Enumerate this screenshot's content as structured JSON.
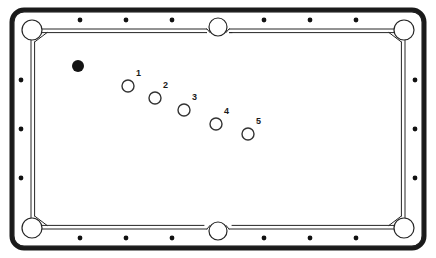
{
  "diagram": {
    "type": "pool-table-top-view",
    "width": 436,
    "height": 258,
    "colors": {
      "frame": "#1a1a1a",
      "cloth": "#ffffff",
      "rail": "#ffffff",
      "cushion_line": "#262626",
      "diamond": "#111111",
      "cue_ball": "#141414",
      "object_ball_outline": "#333333",
      "label_text": "#1a1a1a",
      "page_background": "#ffffff"
    }
  },
  "table": {
    "frame": {
      "name": "outer-frame",
      "x": 12,
      "y": 10,
      "width": 412,
      "height": 238,
      "corner_radius": 12,
      "stroke_width": 5
    },
    "playfield": {
      "name": "cloth-surface",
      "x": 31,
      "y": 29,
      "width": 374,
      "height": 200
    },
    "rail_width": 19
  },
  "pockets": [
    {
      "name": "pocket-top-left",
      "position": "top-left",
      "cx": 32,
      "cy": 30,
      "r": 10
    },
    {
      "name": "pocket-top-middle",
      "position": "top-middle",
      "cx": 218,
      "cy": 27,
      "r": 9
    },
    {
      "name": "pocket-top-right",
      "position": "top-right",
      "cx": 404,
      "cy": 30,
      "r": 10
    },
    {
      "name": "pocket-bottom-left",
      "position": "bottom-left",
      "cx": 32,
      "cy": 228,
      "r": 10
    },
    {
      "name": "pocket-bottom-middle",
      "position": "bottom-middle",
      "cx": 218,
      "cy": 231,
      "r": 9
    },
    {
      "name": "pocket-bottom-right",
      "position": "bottom-right",
      "cx": 404,
      "cy": 228,
      "r": 10
    }
  ],
  "diamonds": {
    "radius": 2.4,
    "top": [
      {
        "name": "diamond-top-1",
        "cx": 80,
        "cy": 20
      },
      {
        "name": "diamond-top-2",
        "cx": 126,
        "cy": 20
      },
      {
        "name": "diamond-top-3",
        "cx": 172,
        "cy": 20
      },
      {
        "name": "diamond-top-4",
        "cx": 264,
        "cy": 20
      },
      {
        "name": "diamond-top-5",
        "cx": 310,
        "cy": 20
      },
      {
        "name": "diamond-top-6",
        "cx": 356,
        "cy": 20
      }
    ],
    "bottom": [
      {
        "name": "diamond-bottom-1",
        "cx": 80,
        "cy": 238
      },
      {
        "name": "diamond-bottom-2",
        "cx": 126,
        "cy": 238
      },
      {
        "name": "diamond-bottom-3",
        "cx": 172,
        "cy": 238
      },
      {
        "name": "diamond-bottom-4",
        "cx": 264,
        "cy": 238
      },
      {
        "name": "diamond-bottom-5",
        "cx": 310,
        "cy": 238
      },
      {
        "name": "diamond-bottom-6",
        "cx": 356,
        "cy": 238
      }
    ],
    "left": [
      {
        "name": "diamond-left-1",
        "cx": 21,
        "cy": 80
      },
      {
        "name": "diamond-left-2",
        "cx": 21,
        "cy": 129
      },
      {
        "name": "diamond-left-3",
        "cx": 21,
        "cy": 178
      }
    ],
    "right": [
      {
        "name": "diamond-right-1",
        "cx": 415,
        "cy": 80
      },
      {
        "name": "diamond-right-2",
        "cx": 415,
        "cy": 129
      },
      {
        "name": "diamond-right-3",
        "cx": 415,
        "cy": 178
      }
    ]
  },
  "balls": {
    "cue": {
      "name": "cue-ball",
      "label": "",
      "cx": 78,
      "cy": 66,
      "r": 6,
      "filled": true
    },
    "objects": [
      {
        "name": "ball-1",
        "label": "1",
        "cx": 128,
        "cy": 86,
        "r": 6,
        "label_x": 136,
        "label_y": 76
      },
      {
        "name": "ball-2",
        "label": "2",
        "cx": 155,
        "cy": 98,
        "r": 6,
        "label_x": 163,
        "label_y": 88
      },
      {
        "name": "ball-3",
        "label": "3",
        "cx": 184,
        "cy": 110,
        "r": 6,
        "label_x": 192,
        "label_y": 100
      },
      {
        "name": "ball-4",
        "label": "4",
        "cx": 216,
        "cy": 124,
        "r": 6,
        "label_x": 224,
        "label_y": 114
      },
      {
        "name": "ball-5",
        "label": "5",
        "cx": 248,
        "cy": 134,
        "r": 6,
        "label_x": 256,
        "label_y": 124
      }
    ]
  }
}
